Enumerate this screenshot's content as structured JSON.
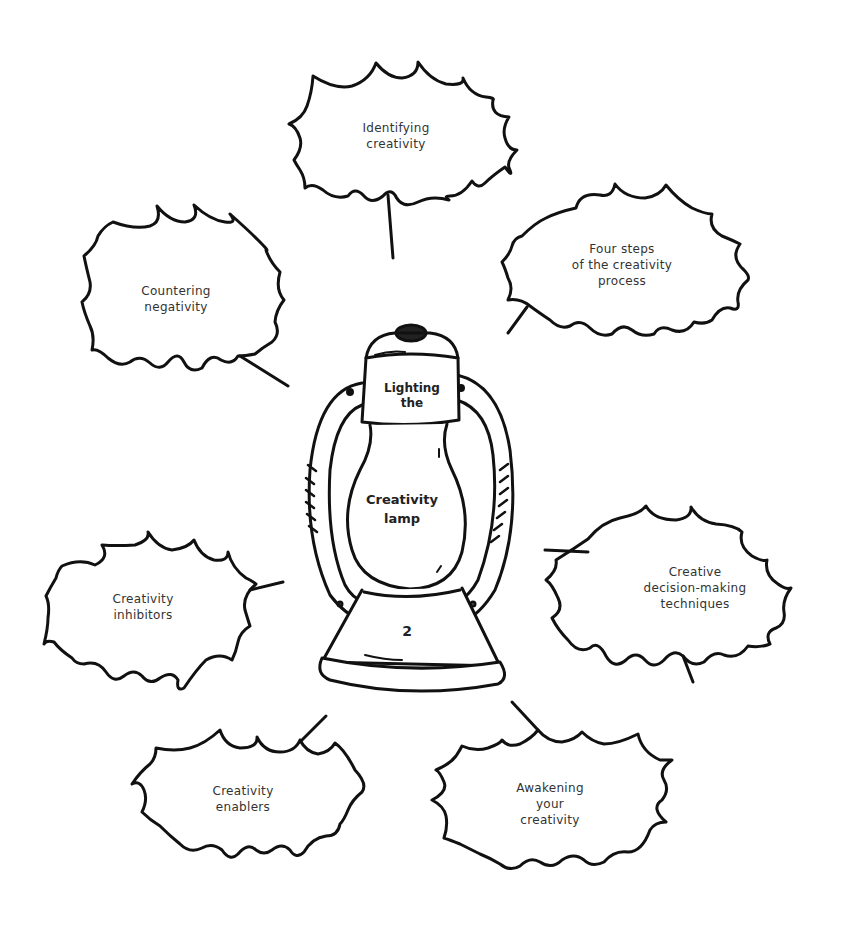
{
  "diagram": {
    "center": {
      "top_label": "Lighting\nthe",
      "main_label": "Creativity\nlamp",
      "marker_1": "1",
      "marker_2": "2"
    },
    "bubbles": [
      {
        "id": "identifying",
        "label": "Identifying\ncreativity"
      },
      {
        "id": "four-steps",
        "label": "Four steps\nof the creativity\nprocess"
      },
      {
        "id": "countering",
        "label": "Countering\nnegativity"
      },
      {
        "id": "decision",
        "label": "Creative\ndecision-making\ntechniques"
      },
      {
        "id": "inhibitors",
        "label": "Creativity\ninhibitors"
      },
      {
        "id": "enablers",
        "label": "Creativity\nenablers"
      },
      {
        "id": "awakening",
        "label": "Awakening\nyour\ncreativity"
      }
    ],
    "colors": {
      "stroke": "#111111",
      "text": "#333333",
      "background": "#ffffff"
    }
  }
}
